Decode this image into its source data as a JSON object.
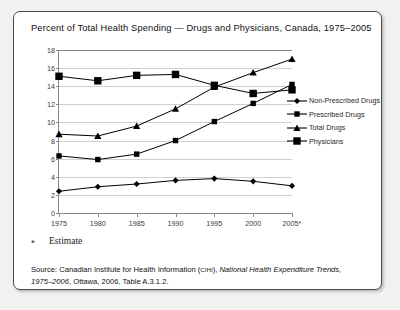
{
  "chart_data": {
    "type": "line",
    "title": "Percent of Total Health Spending — Drugs and Physicians, Canada, 1975–2005",
    "xlabel": "",
    "ylabel": "",
    "categories": [
      "1975",
      "1980",
      "1985",
      "1990",
      "1995",
      "2000",
      "2005*"
    ],
    "x": [
      1975,
      1980,
      1985,
      1990,
      1995,
      2000,
      2005
    ],
    "ylim": [
      0,
      18
    ],
    "yticks": [
      0,
      2,
      4,
      6,
      8,
      10,
      12,
      14,
      16,
      18
    ],
    "grid": true,
    "legend_position": "right",
    "series": [
      {
        "name": "Non-Prescribed Drugs",
        "marker": "diamond",
        "values": [
          2.4,
          2.9,
          3.2,
          3.6,
          3.8,
          3.5,
          3.0
        ]
      },
      {
        "name": "Prescribed Drugs",
        "marker": "square",
        "values": [
          6.3,
          5.9,
          6.5,
          8.0,
          10.1,
          12.1,
          14.2
        ]
      },
      {
        "name": "Total  Drugs",
        "marker": "triangle",
        "values": [
          8.7,
          8.5,
          9.6,
          11.5,
          13.9,
          15.5,
          17.0
        ]
      },
      {
        "name": "Physicians",
        "marker": "square-large",
        "values": [
          15.1,
          14.6,
          15.2,
          15.3,
          14.1,
          13.2,
          13.6
        ]
      }
    ]
  },
  "footnote": {
    "marker": "*",
    "text": "Estimate"
  },
  "source": {
    "prefix": "Source: Canadian Institute for Health Information (",
    "acronym": "CIHI",
    "mid": "), ",
    "italic_title": "National Health Expenditure Trends, 1975–2006",
    "suffix": ", Ottawa, 2006, Table A.3.1.2."
  },
  "colors": {
    "ink": "#111111",
    "axis": "#8a8a8a",
    "grid": "#cfcfcf",
    "border": "#4a4a4a",
    "page": "#f2f1ef"
  }
}
